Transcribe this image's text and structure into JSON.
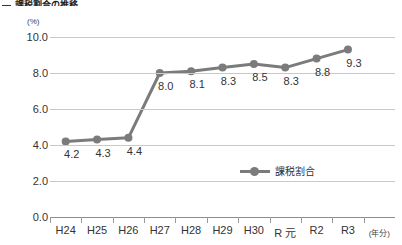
{
  "heading": {
    "bullet": "—",
    "text": "課税割合の推移"
  },
  "legend": {
    "position": "inside-lower-right",
    "label": "課税割合"
  },
  "axis": {
    "y_unit": "(%)",
    "x_unit": "(年分)",
    "y_ticks": [
      "0.0",
      "2.0",
      "4.0",
      "6.0",
      "8.0",
      "10.0"
    ]
  },
  "colors": {
    "series": "#7b7b7b",
    "marker": "#7b7b7b",
    "gridline": "#c9c9c9",
    "axis": "#8d8d8d",
    "text": "#333333"
  },
  "chart_data": {
    "type": "line",
    "title": "課税割合の推移",
    "xlabel": "(年分)",
    "ylabel": "(%)",
    "ylim": [
      0.0,
      10.0
    ],
    "ytick_step": 2.0,
    "grid": true,
    "legend_position": "inside-lower-right",
    "categories": [
      "H24",
      "H25",
      "H26",
      "H27",
      "H28",
      "H29",
      "H30",
      "R 元",
      "R2",
      "R3"
    ],
    "series": [
      {
        "name": "課税割合",
        "values": [
          4.2,
          4.3,
          4.4,
          8.0,
          8.1,
          8.3,
          8.5,
          8.3,
          8.8,
          9.3
        ],
        "labels": [
          "4.2",
          "4.3",
          "4.4",
          "8.0",
          "8.1",
          "8.3",
          "8.5",
          "8.3",
          "8.8",
          "9.3"
        ]
      }
    ]
  }
}
